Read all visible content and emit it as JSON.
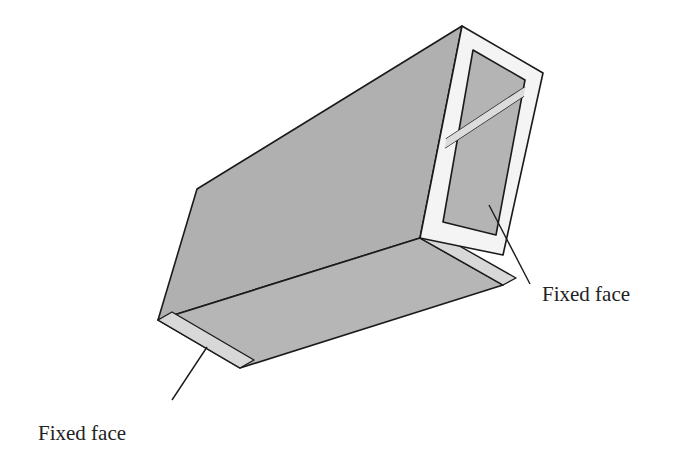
{
  "figure": {
    "labels": [
      {
        "text": "Fixed face",
        "position": "bottom-left"
      },
      {
        "text": "Fixed face",
        "position": "right"
      }
    ],
    "colors": {
      "face_fill": "#b3b3b3",
      "end_face_fill": "#d6d6d6",
      "frame_fill": "#f4f4f4",
      "outline": "#1a1a1a"
    }
  }
}
